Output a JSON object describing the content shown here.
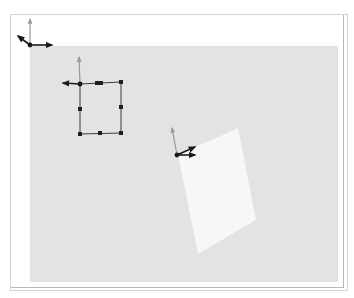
{
  "canvas": {
    "width": 354,
    "height": 298,
    "background": "#ffffff"
  },
  "frame": {
    "outer": {
      "x": 10,
      "y": 14,
      "width": 333,
      "height": 273,
      "stroke": "#b8b8b8"
    },
    "inner_line": {
      "x": 10,
      "y": 14,
      "width": 337,
      "height": 276,
      "stroke": "#d4d4d4"
    }
  },
  "viewport": {
    "x": 30,
    "y": 46,
    "width": 308,
    "height": 236,
    "fill": "#e3e3e3"
  },
  "colors": {
    "axis_dark": "#1a1a1a",
    "axis_gray": "#9a9a9a",
    "handle": "#1e1e1e",
    "edge": "#3a3a3a",
    "plane": "#f7f7f7"
  },
  "gizmos": [
    {
      "name": "world-origin-gizmo",
      "origin": [
        30,
        45
      ],
      "axes": [
        {
          "label": "y",
          "to": [
            30,
            19
          ],
          "color": "axis_gray"
        },
        {
          "label": "x",
          "to": [
            52,
            45
          ],
          "color": "axis_dark"
        },
        {
          "label": "z",
          "to": [
            18,
            36
          ],
          "color": "axis_dark"
        }
      ]
    },
    {
      "name": "square-gizmo",
      "origin": [
        80,
        84
      ],
      "axes": [
        {
          "label": "y",
          "to": [
            79,
            57
          ],
          "color": "axis_gray"
        },
        {
          "label": "x",
          "to": [
            63,
            83
          ],
          "color": "axis_dark"
        }
      ]
    },
    {
      "name": "plane-gizmo",
      "origin": [
        177,
        155
      ],
      "axes": [
        {
          "label": "y",
          "to": [
            172,
            128
          ],
          "color": "axis_gray"
        },
        {
          "label": "x",
          "to": [
            195,
            155
          ],
          "color": "axis_dark"
        },
        {
          "label": "z",
          "to": [
            195,
            147
          ],
          "color": "axis_dark"
        }
      ]
    }
  ],
  "square_shape": {
    "corners": [
      [
        80,
        84
      ],
      [
        121,
        82
      ],
      [
        121,
        133
      ],
      [
        80,
        134
      ]
    ],
    "handles": [
      [
        80,
        84
      ],
      [
        121,
        82
      ],
      [
        121,
        133
      ],
      [
        80,
        134
      ],
      [
        80,
        109
      ],
      [
        121,
        107
      ],
      [
        100,
        133
      ],
      [
        97,
        83
      ],
      [
        101,
        83
      ]
    ]
  },
  "plane_shape": {
    "points": [
      [
        178,
        155
      ],
      [
        238,
        128
      ],
      [
        256,
        220
      ],
      [
        198,
        254
      ]
    ]
  }
}
